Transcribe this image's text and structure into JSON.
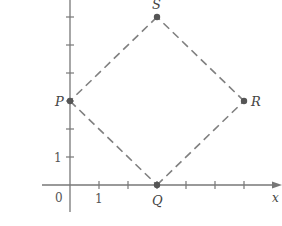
{
  "chart_data": {
    "type": "scatter",
    "title": "",
    "xlabel": "x",
    "ylabel": "",
    "origin_label": "0",
    "x_tick_label": "1",
    "y_tick_label": "1",
    "x_ticks": [
      1,
      2,
      3,
      4,
      5,
      6
    ],
    "y_ticks": [
      1,
      2,
      3,
      4,
      5,
      6
    ],
    "points": [
      {
        "name": "P",
        "x": 0,
        "y": 3
      },
      {
        "name": "Q",
        "x": 3,
        "y": 0
      },
      {
        "name": "R",
        "x": 6,
        "y": 3
      },
      {
        "name": "S",
        "x": 3,
        "y": 6
      }
    ],
    "polygon": [
      "P",
      "Q",
      "R",
      "S"
    ],
    "line_style": "dashed",
    "xlim": [
      -0.5,
      7.3
    ],
    "ylim": [
      -1.5,
      6.6
    ]
  },
  "colors": {
    "axis": "#777777",
    "dash": "#808080",
    "point": "#555555",
    "text": "#444444"
  }
}
